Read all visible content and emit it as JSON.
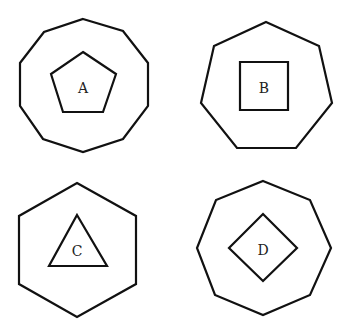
{
  "figures": [
    {
      "label": "A",
      "outer_shape": "decagon",
      "inner_shape": "pentagon",
      "outer_points": "83,19 123,31 148,63 148,106 123,139 83,152 43,139 20,106 20,63 44,32",
      "inner_points": "83,52 116,74 103,112 63,112 51,74",
      "label_x": 83,
      "label_y": 88
    },
    {
      "label": "B",
      "outer_shape": "heptagon",
      "inner_shape": "square",
      "outer_points": "266,22 319,46 332,103 296,148 237,148 201,103 214,46",
      "inner_points": "240,62 288,62 288,110 240,110",
      "label_x": 264,
      "label_y": 88
    },
    {
      "label": "C",
      "outer_shape": "hexagon",
      "inner_shape": "triangle",
      "outer_points": "77,183 136,216 136,284 77,317 19,284 19,216",
      "inner_points": "77,215 107,266 49,266",
      "label_x": 77,
      "label_y": 251
    },
    {
      "label": "D",
      "outer_shape": "octagon",
      "inner_shape": "diamond",
      "outer_points": "263,181 310,200 331,248 310,295 263,315 215,295 197,248 216,200",
      "inner_points": "263,214 297,248 263,281 229,248",
      "label_x": 263,
      "label_y": 250
    }
  ]
}
